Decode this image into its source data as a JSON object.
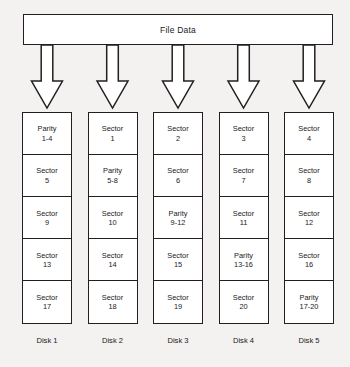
{
  "header": {
    "title": "File Data"
  },
  "icons": {
    "arrow": "down-block-arrow-icon"
  },
  "colors": {
    "background": "#f3f2f0",
    "box_fill": "#ffffff",
    "stroke": "#231f20",
    "text": "#1a1a1a"
  },
  "disks": [
    {
      "label": "Disk 1",
      "cells": [
        {
          "kind": "Parity",
          "range": "1-4"
        },
        {
          "kind": "Sector",
          "range": "5"
        },
        {
          "kind": "Sector",
          "range": "9"
        },
        {
          "kind": "Sector",
          "range": "13"
        },
        {
          "kind": "Sector",
          "range": "17"
        }
      ]
    },
    {
      "label": "Disk 2",
      "cells": [
        {
          "kind": "Sector",
          "range": "1"
        },
        {
          "kind": "Parity",
          "range": "5-8"
        },
        {
          "kind": "Sector",
          "range": "10"
        },
        {
          "kind": "Sector",
          "range": "14"
        },
        {
          "kind": "Sector",
          "range": "18"
        }
      ]
    },
    {
      "label": "Disk 3",
      "cells": [
        {
          "kind": "Sector",
          "range": "2"
        },
        {
          "kind": "Sector",
          "range": "6"
        },
        {
          "kind": "Parity",
          "range": "9-12"
        },
        {
          "kind": "Sector",
          "range": "15"
        },
        {
          "kind": "Sector",
          "range": "19"
        }
      ]
    },
    {
      "label": "Disk 4",
      "cells": [
        {
          "kind": "Sector",
          "range": "3"
        },
        {
          "kind": "Sector",
          "range": "7"
        },
        {
          "kind": "Sector",
          "range": "11"
        },
        {
          "kind": "Parity",
          "range": "13-16"
        },
        {
          "kind": "Sector",
          "range": "20"
        }
      ]
    },
    {
      "label": "Disk 5",
      "cells": [
        {
          "kind": "Sector",
          "range": "4"
        },
        {
          "kind": "Sector",
          "range": "8"
        },
        {
          "kind": "Sector",
          "range": "12"
        },
        {
          "kind": "Sector",
          "range": "16"
        },
        {
          "kind": "Parity",
          "range": "17-20"
        }
      ]
    }
  ]
}
